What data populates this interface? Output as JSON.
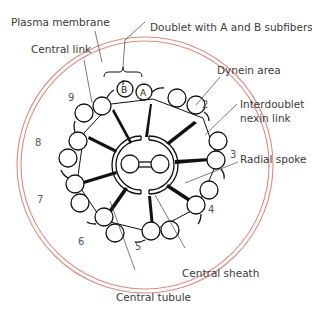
{
  "diagram": {
    "labels": {
      "plasma_membrane": "Plasma membrane",
      "doublet": "Doublet with A and B subfibers",
      "central_link": "Central link",
      "dynein_area": "Dynein area",
      "nexin_line1": "Interdoublet",
      "nexin_line2": "nexin link",
      "radial_spoke": "Radial spoke",
      "central_sheath": "Central sheath",
      "central_tubule": "Central tubule"
    },
    "subfibers": {
      "a": "A",
      "b": "B"
    },
    "doublet_numbers": [
      "1",
      "2",
      "3",
      "4",
      "5",
      "6",
      "7",
      "8",
      "9"
    ],
    "colors": {
      "membrane": "#e08a80",
      "line": "#111111",
      "leader": "#444444",
      "text": "#3a3a3a"
    }
  }
}
